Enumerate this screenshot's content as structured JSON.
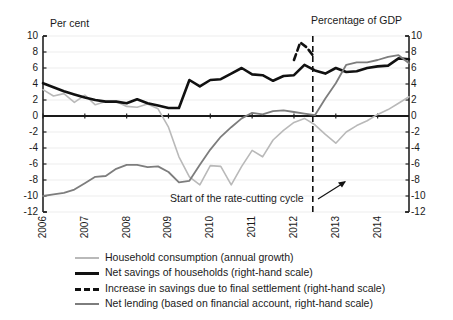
{
  "chart_data": {
    "type": "line",
    "title": "",
    "left_axis_title": "Per cent",
    "right_axis_title": "Percentage of GDP",
    "xlabel": "",
    "ylabel": "Per cent",
    "ylim": [
      -12,
      10
    ],
    "yticks": [
      10,
      8,
      6,
      4,
      2,
      0,
      -2,
      -4,
      -6,
      -8,
      -10,
      -12
    ],
    "right_ylim": [
      -12,
      10
    ],
    "right_yticks": [
      10,
      8,
      6,
      4,
      2,
      0,
      -2,
      -4,
      -6,
      -8,
      -10,
      -12
    ],
    "xlim": [
      2006.0,
      2014.75
    ],
    "categories": [
      "2006",
      "2007",
      "2008",
      "2009",
      "2010",
      "2011",
      "2012",
      "2013",
      "2014"
    ],
    "xticks": [
      2006,
      2007,
      2008,
      2009,
      2010,
      2011,
      2012,
      2013,
      2014
    ],
    "grid": true,
    "legend_position": "below",
    "annotations": [
      {
        "text": "Start of the rate-cutting cycle",
        "x": 2012.45,
        "y": -10.5
      },
      {
        "text": "vertical dashed reference line",
        "x": 2012.45
      }
    ],
    "vline_x": 2012.45,
    "series": [
      {
        "name": "Household consumption (annual growth)",
        "color": "#b9b9b9",
        "style": "solid",
        "width": 1.6,
        "scale": "left",
        "x": [
          2006.0,
          2006.25,
          2006.5,
          2006.75,
          2007.0,
          2007.25,
          2007.5,
          2007.75,
          2008.0,
          2008.25,
          2008.5,
          2008.75,
          2009.0,
          2009.25,
          2009.5,
          2009.75,
          2010.0,
          2010.25,
          2010.5,
          2010.75,
          2011.0,
          2011.25,
          2011.5,
          2011.75,
          2012.0,
          2012.25,
          2012.5,
          2012.75,
          2013.0,
          2013.25,
          2013.5,
          2013.75,
          2014.0,
          2014.25,
          2014.5,
          2014.75
        ],
        "values": [
          3.3,
          2.5,
          2.8,
          1.7,
          2.6,
          1.4,
          1.8,
          1.8,
          1.2,
          1.1,
          1.5,
          0.9,
          -1.4,
          -5.1,
          -7.6,
          -8.6,
          -6.2,
          -6.3,
          -8.6,
          -6.3,
          -4.3,
          -5.1,
          -3.0,
          -1.8,
          -0.8,
          -0.3,
          -1.1,
          -2.3,
          -3.4,
          -2.0,
          -1.2,
          -0.6,
          0.2,
          0.8,
          1.6,
          2.4
        ]
      },
      {
        "name": "Net savings of households (right-hand scale)",
        "color": "#111111",
        "style": "solid",
        "width": 2.6,
        "scale": "right",
        "x": [
          2006.0,
          2006.25,
          2006.5,
          2006.75,
          2007.0,
          2007.25,
          2007.5,
          2007.75,
          2008.0,
          2008.25,
          2008.5,
          2008.75,
          2009.0,
          2009.25,
          2009.5,
          2009.75,
          2010.0,
          2010.25,
          2010.5,
          2010.75,
          2011.0,
          2011.25,
          2011.5,
          2011.75,
          2012.0,
          2012.25,
          2012.5,
          2012.75,
          2013.0,
          2013.25,
          2013.5,
          2013.75,
          2014.0,
          2014.25,
          2014.5,
          2014.75
        ],
        "values": [
          4.1,
          3.6,
          3.1,
          2.7,
          2.3,
          2.0,
          1.8,
          1.8,
          1.6,
          2.1,
          1.6,
          1.3,
          1.0,
          1.0,
          4.5,
          3.7,
          4.5,
          4.6,
          5.3,
          6.0,
          5.2,
          5.1,
          4.4,
          5.0,
          5.1,
          6.4,
          5.7,
          5.3,
          6.0,
          5.5,
          5.6,
          6.0,
          6.2,
          6.3,
          7.2,
          7.1
        ]
      },
      {
        "name": "Increase in savings due to final settlement (right-hand scale)",
        "color": "#111111",
        "style": "dashed",
        "width": 2.6,
        "scale": "right",
        "x": [
          2012.0,
          2012.15,
          2012.3,
          2012.45
        ],
        "values": [
          7.0,
          9.2,
          8.6,
          7.6
        ]
      },
      {
        "name": "Net lending (based on financial account, right-hand scale)",
        "color": "#7d7d7d",
        "style": "solid",
        "width": 1.8,
        "scale": "right",
        "x": [
          2006.0,
          2006.25,
          2006.5,
          2006.75,
          2007.0,
          2007.25,
          2007.5,
          2007.75,
          2008.0,
          2008.25,
          2008.5,
          2008.75,
          2009.0,
          2009.25,
          2009.5,
          2009.75,
          2010.0,
          2010.25,
          2010.5,
          2010.75,
          2011.0,
          2011.25,
          2011.5,
          2011.75,
          2012.0,
          2012.25,
          2012.5,
          2012.75,
          2013.0,
          2013.25,
          2013.5,
          2013.75,
          2014.0,
          2014.25,
          2014.5,
          2014.75
        ],
        "values": [
          -10.0,
          -9.8,
          -9.6,
          -9.2,
          -8.4,
          -7.6,
          -7.5,
          -6.6,
          -6.1,
          -6.1,
          -6.4,
          -6.3,
          -7.0,
          -8.3,
          -8.1,
          -6.1,
          -4.2,
          -2.6,
          -1.4,
          -0.3,
          0.4,
          0.2,
          0.6,
          0.7,
          0.5,
          0.3,
          0.1,
          2.2,
          4.1,
          6.4,
          6.7,
          6.7,
          7.0,
          7.4,
          7.6,
          6.6
        ]
      }
    ]
  },
  "legend": {
    "items": [
      {
        "label": "Household consumption (annual growth)",
        "swatch": "solid-light-gray"
      },
      {
        "label": "Net savings of households (right-hand scale)",
        "swatch": "solid-black-thick"
      },
      {
        "label": "Increase in savings due to final settlement (right-hand scale)",
        "swatch": "dashed-black"
      },
      {
        "label": "Net lending (based on financial account, right-hand scale)",
        "swatch": "solid-gray"
      }
    ]
  },
  "annotation": {
    "text": "Start of the rate-cutting cycle"
  }
}
